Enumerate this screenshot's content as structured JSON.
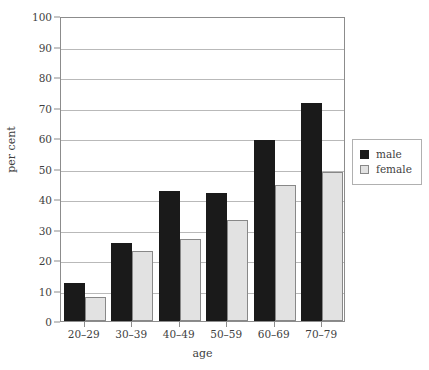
{
  "chart_data": {
    "type": "bar",
    "title": "",
    "xlabel": "age",
    "ylabel": "per cent",
    "categories": [
      "20–29",
      "30–39",
      "40–49",
      "50–59",
      "60–69",
      "70–79"
    ],
    "series": [
      {
        "name": "male",
        "color": "#1a1a1a",
        "values": [
          12.5,
          25.5,
          42.5,
          42,
          59.5,
          71.5
        ]
      },
      {
        "name": "female",
        "color": "#e2e2e2",
        "values": [
          8,
          23,
          27,
          33,
          44.5,
          49
        ]
      }
    ],
    "ylim": [
      0,
      100
    ],
    "yticks": [
      0,
      10,
      20,
      30,
      40,
      50,
      60,
      70,
      80,
      90,
      100
    ],
    "ytick_labels": [
      "0",
      "10",
      "20",
      "30",
      "40",
      "50",
      "60",
      "70",
      "80",
      "90",
      "100"
    ],
    "grid": true,
    "grid_axis": "y",
    "legend_position": "right",
    "legend_entries": [
      "male",
      "female"
    ]
  },
  "colors": {
    "male_fill": "#1a1a1a",
    "male_edge": "#1a1a1a",
    "female_fill": "#e2e2e2",
    "female_edge": "#888888",
    "gridline": "#b9b9b9",
    "frame": "#8c8c8c",
    "text": "#3f3f3f",
    "background": "#ffffff"
  }
}
